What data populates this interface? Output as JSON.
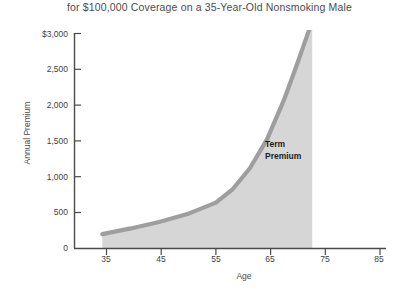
{
  "chart_data": {
    "type": "area",
    "title": "for $100,000 Coverage on a 35-Year-Old Nonsmoking Male",
    "xlabel": "Age",
    "ylabel": "Annual Premium",
    "xlim": [
      30,
      85
    ],
    "ylim": [
      0,
      3000
    ],
    "xticks": [
      35,
      45,
      55,
      65,
      75,
      85
    ],
    "xtick_labels": [
      "35",
      "45",
      "55",
      "65",
      "75",
      "85"
    ],
    "yticks": [
      0,
      500,
      1000,
      1500,
      2000,
      2500,
      3000
    ],
    "ytick_labels": [
      "0",
      "500",
      "1,000",
      "1,500",
      "2,000",
      "2,500",
      "$3,000"
    ],
    "grid": false,
    "legend": false,
    "series": [
      {
        "name": "Term Premium",
        "x": [
          35,
          40,
          45,
          50,
          55,
          58,
          61,
          64,
          67,
          69,
          71,
          72
        ],
        "values": [
          200,
          280,
          370,
          480,
          640,
          830,
          1120,
          1520,
          2070,
          2500,
          2950,
          3180
        ],
        "line_color": "#9e9e9e",
        "fill_color": "#d6d6d6"
      }
    ],
    "annotations": [
      {
        "text_line1": "Term",
        "text_line2": "Premium",
        "x": 65,
        "y": 1400
      }
    ],
    "axis_color": "#4a4a4a",
    "background": "#ffffff"
  }
}
